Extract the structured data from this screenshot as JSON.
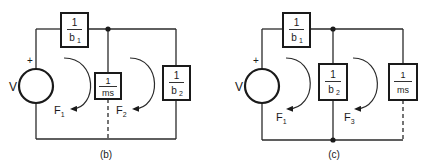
{
  "diagram": {
    "type": "mechanical-electrical analog circuit (mobility network)",
    "circuits": [
      {
        "id": "b",
        "caption": "(b)",
        "source": {
          "label": "V",
          "polarity": "+"
        },
        "elements": [
          {
            "id": "b1",
            "num": "1",
            "den": "b",
            "sub": "1",
            "position": "top series"
          },
          {
            "id": "ms",
            "num": "1",
            "den": "ms",
            "sub": "",
            "position": "middle shunt (dashed lower lead)"
          },
          {
            "id": "b2",
            "num": "1",
            "den": "b",
            "sub": "2",
            "position": "right shunt"
          }
        ],
        "loops": [
          {
            "label": "F",
            "sub": "1"
          },
          {
            "label": "F",
            "sub": "2"
          }
        ]
      },
      {
        "id": "c",
        "caption": "(c)",
        "source": {
          "label": "V",
          "polarity": "+"
        },
        "elements": [
          {
            "id": "b1",
            "num": "1",
            "den": "b",
            "sub": "1",
            "position": "top series"
          },
          {
            "id": "b2",
            "num": "1",
            "den": "b",
            "sub": "2",
            "position": "middle shunt"
          },
          {
            "id": "ms",
            "num": "1",
            "den": "ms",
            "sub": "",
            "position": "right shunt (dashed lower lead)"
          }
        ],
        "loops": [
          {
            "label": "F",
            "sub": "1"
          },
          {
            "label": "F",
            "sub": "3"
          }
        ]
      }
    ]
  },
  "colors": {
    "ink": "#1a1a1a",
    "background": "#ffffff"
  }
}
